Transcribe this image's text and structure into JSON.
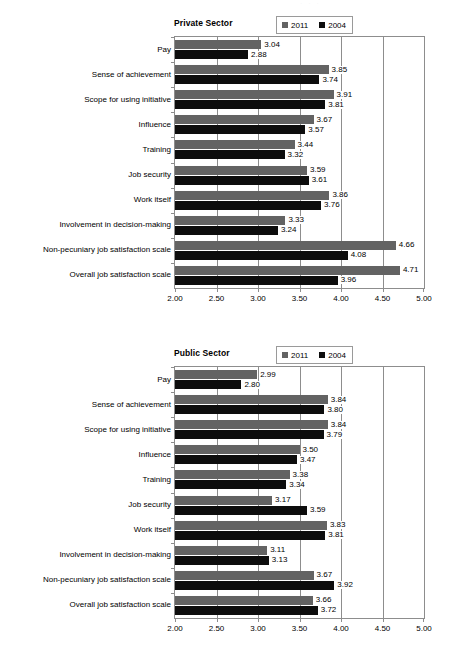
{
  "figure": {
    "scan_artifact_text": "· · ·",
    "legend": {
      "entries": [
        {
          "label": "2011",
          "color": "#636363"
        },
        {
          "label": "2004",
          "color": "#0d0d0d"
        }
      ]
    },
    "axis": {
      "ticks": [
        "2.00",
        "2.50",
        "3.00",
        "3.50",
        "4.00",
        "4.50",
        "5.00"
      ],
      "min": 2.0,
      "max": 5.0
    }
  },
  "chart_data": [
    {
      "type": "bar",
      "orientation": "horizontal",
      "title": "Private Sector",
      "xlabel": "",
      "ylabel": "",
      "xlim": [
        2.0,
        5.0
      ],
      "xticks": [
        "2.00",
        "2.50",
        "3.00",
        "3.50",
        "4.00",
        "4.50",
        "5.00"
      ],
      "grid": true,
      "legend_position": "top-right",
      "categories": [
        "Pay",
        "Sense of achievement",
        "Scope for using initiative",
        "Influence",
        "Training",
        "Job security",
        "Work itself",
        "Involvement in decision-making",
        "Non-pecuniary job satisfaction scale",
        "Overall job satisfaction scale"
      ],
      "series": [
        {
          "name": "2011",
          "color": "#636363",
          "values": [
            3.04,
            3.85,
            3.91,
            3.67,
            3.44,
            3.59,
            3.86,
            3.33,
            4.66,
            4.71
          ],
          "labels": [
            "3.04",
            "3.85",
            "3.91",
            "3.67",
            "3.44",
            "3.59",
            "3.86",
            "3.33",
            "4.66",
            "4.71"
          ]
        },
        {
          "name": "2004",
          "color": "#0d0d0d",
          "values": [
            2.88,
            3.74,
            3.81,
            3.57,
            3.32,
            3.61,
            3.76,
            3.24,
            4.08,
            3.96
          ],
          "labels": [
            "2.88",
            "3.74",
            "3.81",
            "3.57",
            "3.32",
            "3.61",
            "3.76",
            "3.24",
            "4.08",
            "3.96"
          ]
        }
      ]
    },
    {
      "type": "bar",
      "orientation": "horizontal",
      "title": "Public Sector",
      "xlabel": "",
      "ylabel": "",
      "xlim": [
        2.0,
        5.0
      ],
      "xticks": [
        "2.00",
        "2.50",
        "3.00",
        "3.50",
        "4.00",
        "4.50",
        "5.00"
      ],
      "grid": true,
      "legend_position": "top-right",
      "categories": [
        "Pay",
        "Sense of achievement",
        "Scope for using initiative",
        "Influence",
        "Training",
        "Job security",
        "Work itself",
        "Involvement in decision-making",
        "Non-pecuniary job satisfaction scale",
        "Overall job satisfaction scale"
      ],
      "series": [
        {
          "name": "2011",
          "color": "#636363",
          "values": [
            2.99,
            3.84,
            3.84,
            3.5,
            3.38,
            3.17,
            3.83,
            3.11,
            3.67,
            3.66
          ],
          "labels": [
            "2.99",
            "3.84",
            "3.84",
            "3.50",
            "3.38",
            "3.17",
            "3.83",
            "3.11",
            "3.67",
            "3.66"
          ]
        },
        {
          "name": "2004",
          "color": "#0d0d0d",
          "values": [
            2.8,
            3.8,
            3.79,
            3.47,
            3.34,
            3.59,
            3.81,
            3.13,
            3.92,
            3.72
          ],
          "labels": [
            "2.80",
            "3.80",
            "3.79",
            "3.47",
            "3.34",
            "3.59",
            "3.81",
            "3.13",
            "3.92",
            "3.72"
          ]
        }
      ]
    }
  ]
}
